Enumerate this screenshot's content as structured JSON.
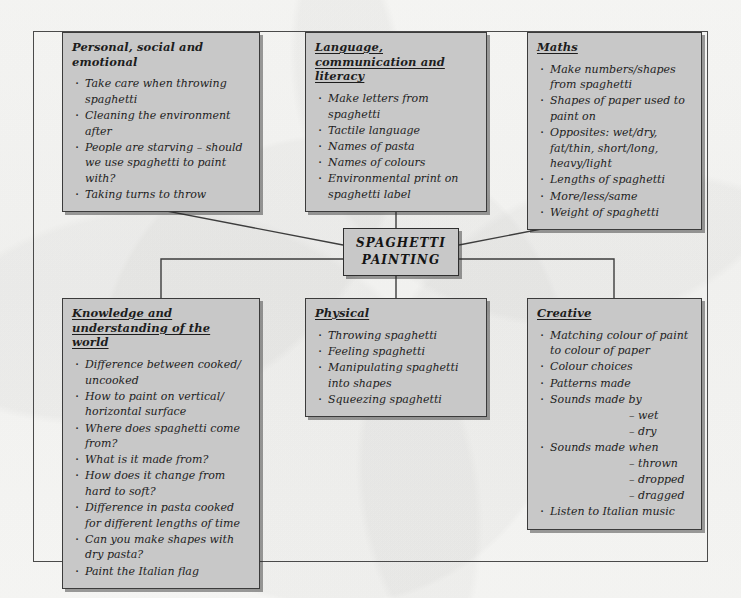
{
  "diagram": {
    "center": {
      "line1": "SPAGHETTI",
      "line2": "PAINTING"
    },
    "colors": {
      "box_fill": "#c8c8c8",
      "box_border": "#3b3b3b",
      "page": "#fdfdfb",
      "frame": "#4a4a4a"
    },
    "nodes": [
      {
        "id": "personal-social-emotional",
        "heading": "Personal, social and emotional",
        "heading_underlined": false,
        "items": [
          "Take care when throwing spaghetti",
          "Cleaning the environment after",
          "People are starving – should we use spaghetti to paint with?",
          "Taking turns to throw"
        ]
      },
      {
        "id": "language-communication-literacy",
        "heading": "Language, communication and literacy",
        "heading_underlined": true,
        "items": [
          "Make letters from spaghetti",
          "Tactile language",
          "Names of pasta",
          "Names of colours",
          "Environmental print on spaghetti label"
        ]
      },
      {
        "id": "maths",
        "heading": "Maths",
        "heading_underlined": true,
        "items": [
          "Make numbers/shapes from spaghetti",
          "Shapes of paper used to paint on",
          "Opposites: wet/dry, fat/thin, short/long, heavy/light",
          "Lengths of spaghetti",
          "More/less/same",
          "Weight of spaghetti"
        ]
      },
      {
        "id": "knowledge-understanding-world",
        "heading": "Knowledge and understanding of the world",
        "heading_underlined": true,
        "items": [
          "Difference between cooked/ uncooked",
          "How to paint on vertical/ horizontal surface",
          "Where does spaghetti come from?",
          "What is it made from?",
          "How does it change from hard to soft?",
          "Difference in pasta cooked for different lengths of time",
          "Can you make shapes with dry pasta?",
          "Paint the Italian flag"
        ]
      },
      {
        "id": "physical",
        "heading": "Physical",
        "heading_underlined": true,
        "items": [
          "Throwing spaghetti",
          "Feeling spaghetti",
          "Manipulating spaghetti into shapes",
          "Squeezing spaghetti"
        ]
      },
      {
        "id": "creative",
        "heading": "Creative",
        "heading_underlined": true,
        "items": [
          "Matching colour of paint to colour of paper",
          "Colour choices",
          "Patterns made",
          "Sounds made by",
          "– wet",
          "– dry",
          "Sounds made when",
          "– thrown",
          "– dropped",
          "– dragged",
          "Listen to Italian music"
        ],
        "sub_item_indices": [
          4,
          5,
          7,
          8,
          9
        ]
      }
    ]
  }
}
